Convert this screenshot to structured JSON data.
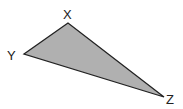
{
  "diagram": {
    "type": "triangle",
    "fill_color": "#b0b0b0",
    "stroke_color": "#222222",
    "vertices": [
      {
        "name": "X",
        "label": "X",
        "x": 68,
        "y": 23,
        "label_x": 63,
        "label_y": 19
      },
      {
        "name": "Y",
        "label": "Y",
        "x": 24,
        "y": 54,
        "label_x": 7,
        "label_y": 60
      },
      {
        "name": "Z",
        "label": "Z",
        "x": 164,
        "y": 97,
        "label_x": 166,
        "label_y": 104
      }
    ]
  }
}
